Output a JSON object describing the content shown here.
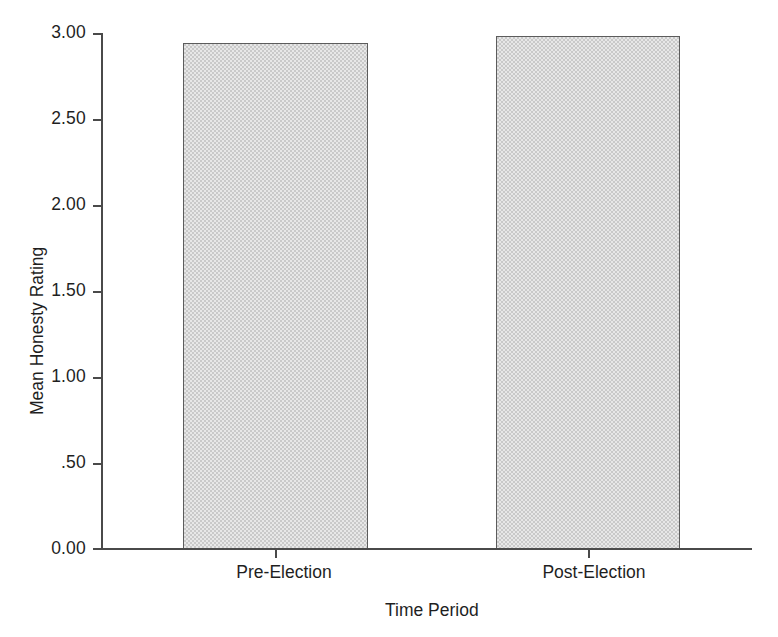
{
  "chart_data": {
    "type": "bar",
    "title": "",
    "xlabel": "Time Period",
    "ylabel": "Mean Honesty Rating",
    "categories": [
      "Pre-Election",
      "Post-Election"
    ],
    "values": [
      2.94,
      2.98
    ],
    "ylim": [
      0.0,
      3.0
    ],
    "ytick_values": [
      0.0,
      0.5,
      1.0,
      1.5,
      2.0,
      2.5,
      3.0
    ],
    "ytick_labels": [
      "0.00",
      ".50",
      "1.00",
      "1.50",
      "2.00",
      "2.50",
      "3.00"
    ],
    "grid": false,
    "legend": false,
    "legend_position": "none",
    "bar_fill_color": "#c9c9c9",
    "bar_border_color": "#5c5c5c",
    "axis_color": "#4a4a4a",
    "background_color": "#ffffff"
  },
  "axes": {
    "y_title": "Mean Honesty Rating",
    "x_title": "Time Period"
  },
  "ticks": {
    "y": [
      {
        "label": "3.00",
        "value": 3.0
      },
      {
        "label": "2.50",
        "value": 2.5
      },
      {
        "label": "2.00",
        "value": 2.0
      },
      {
        "label": "1.50",
        "value": 1.5
      },
      {
        "label": "1.00",
        "value": 1.0
      },
      {
        "label": ".50",
        "value": 0.5
      },
      {
        "label": "0.00",
        "value": 0.0
      }
    ],
    "x": [
      {
        "label": "Pre-Election"
      },
      {
        "label": "Post-Election"
      }
    ]
  },
  "bars": [
    {
      "label": "Pre-Election",
      "value": 2.94
    },
    {
      "label": "Post-Election",
      "value": 2.98
    }
  ]
}
